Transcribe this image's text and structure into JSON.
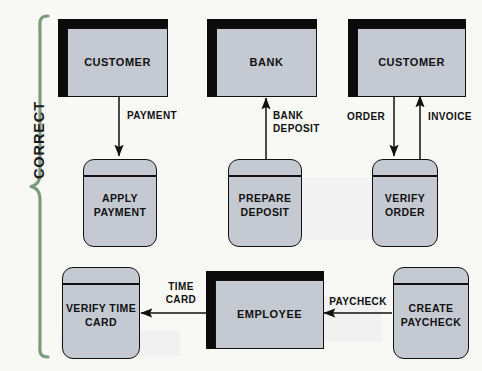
{
  "diagram": {
    "bracket_label": "CORRECT",
    "bracket_color": "#7d9b7d",
    "entity_fill": "#c4c9d2",
    "process_fill": "#c4c9d2",
    "line_color": "#111111",
    "background": "#f8f8f5"
  },
  "entities": [
    {
      "id": "customer-payment",
      "label": "CUSTOMER"
    },
    {
      "id": "bank",
      "label": "BANK"
    },
    {
      "id": "customer-order",
      "label": "CUSTOMER"
    },
    {
      "id": "employee",
      "label": "EMPLOYEE"
    }
  ],
  "processes": [
    {
      "id": "apply-payment",
      "label": "APPLY\nPAYMENT"
    },
    {
      "id": "prepare-deposit",
      "label": "PREPARE\nDEPOSIT"
    },
    {
      "id": "verify-order",
      "label": "VERIFY\nORDER"
    },
    {
      "id": "verify-time-card",
      "label": "VERIFY\nTIME\nCARD"
    },
    {
      "id": "create-paycheck",
      "label": "CREATE\nPAYCHECK"
    }
  ],
  "flows": [
    {
      "id": "payment",
      "label": "PAYMENT",
      "from": "customer-payment",
      "to": "apply-payment",
      "direction": "down"
    },
    {
      "id": "bank-deposit",
      "label": "BANK\nDEPOSIT",
      "from": "prepare-deposit",
      "to": "bank",
      "direction": "up"
    },
    {
      "id": "order",
      "label": "ORDER",
      "from": "customer-order",
      "to": "verify-order",
      "direction": "down"
    },
    {
      "id": "invoice",
      "label": "INVOICE",
      "from": "verify-order",
      "to": "customer-order",
      "direction": "up"
    },
    {
      "id": "time-card",
      "label": "TIME\nCARD",
      "from": "employee",
      "to": "verify-time-card",
      "direction": "left"
    },
    {
      "id": "paycheck",
      "label": "PAYCHECK",
      "from": "create-paycheck",
      "to": "employee",
      "direction": "left"
    }
  ]
}
